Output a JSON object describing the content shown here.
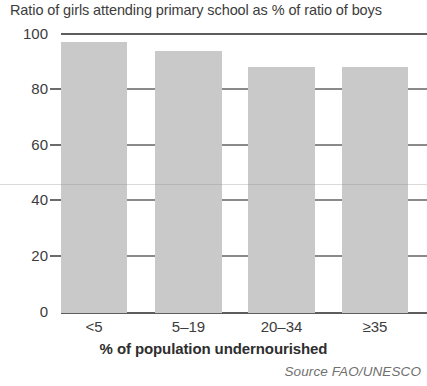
{
  "chart_data": {
    "type": "bar",
    "title": "Ratio of girls attending primary school as % of ratio of boys",
    "xlabel": "% of population undernourished",
    "ylabel": "",
    "source": "Source FAO/UNESCO",
    "categories": [
      "<5",
      "5–19",
      "20–34",
      "≥35"
    ],
    "values": [
      97,
      94,
      88,
      88
    ],
    "ylim": [
      0,
      100
    ],
    "yticks": [
      0,
      20,
      40,
      60,
      80,
      100
    ],
    "ytick_labels": [
      "0",
      "20",
      "40",
      "60",
      "80",
      "100"
    ],
    "grid": "horizontal-ticks-only",
    "legend": "none",
    "bar_color": "#c9c9c9",
    "axis_color": "#5d5d5d",
    "text_color": "#3c3c3c"
  }
}
